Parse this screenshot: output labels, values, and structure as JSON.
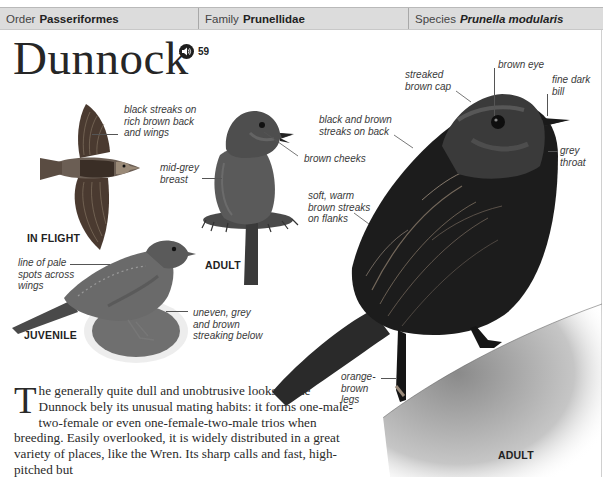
{
  "header": {
    "order": {
      "label": "Order",
      "value": "Passeriformes"
    },
    "family": {
      "label": "Family",
      "value": "Prunellidae"
    },
    "species": {
      "label": "Species",
      "value": "Prunella modularis"
    }
  },
  "title": "Dunnock",
  "audio": {
    "icon": "speaker-icon",
    "track_number": "59"
  },
  "figures": {
    "in_flight": {
      "caption": "IN FLIGHT",
      "annotations": [
        "black streaks on rich brown back and wings"
      ]
    },
    "adult_small": {
      "caption": "ADULT",
      "annotations": [
        "mid-grey breast",
        "brown cheeks"
      ]
    },
    "juvenile": {
      "caption": "JUVENILE",
      "annotations": [
        "line of pale spots across wings",
        "uneven, grey and brown streaking below"
      ]
    },
    "adult_large": {
      "caption": "ADULT",
      "annotations": [
        "streaked brown cap",
        "brown eye",
        "fine dark bill",
        "black and brown streaks on back",
        "grey throat",
        "soft, warm brown streaks on flanks",
        "orange-brown legs"
      ]
    }
  },
  "annotation_lines": {
    "flight_1": "black streaks on",
    "flight_2": "rich brown back",
    "flight_3": "and wings",
    "breast_1": "mid-grey",
    "breast_2": "breast",
    "cheeks": "brown cheeks",
    "juv_spots_1": "line of pale",
    "juv_spots_2": "spots across",
    "juv_spots_3": "wings",
    "juv_streak_1": "uneven, grey",
    "juv_streak_2": "and brown",
    "juv_streak_3": "streaking below",
    "cap_1": "streaked",
    "cap_2": "brown cap",
    "eye": "brown eye",
    "bill_1": "fine dark",
    "bill_2": "bill",
    "back_1": "black and brown",
    "back_2": "streaks on back",
    "throat_1": "grey",
    "throat_2": "throat",
    "flanks_1": "soft, warm",
    "flanks_2": "brown streaks",
    "flanks_3": "on flanks",
    "legs_1": "orange-",
    "legs_2": "brown",
    "legs_3": "legs"
  },
  "body_text": {
    "dropcap": "T",
    "text": "he generally quite dull and unobtrusive looks of the Dunnock bely its unusual mating habits: it forms one-male-two-female or even one-female-two-male trios when breeding. Easily overlooked, it is widely distributed in a great variety of places, like the Wren. Its sharp calls and fast, high-pitched but"
  },
  "colors": {
    "header_bg": "#dcdcdc",
    "text": "#222222",
    "bird_dark": "#1c1c1c"
  }
}
